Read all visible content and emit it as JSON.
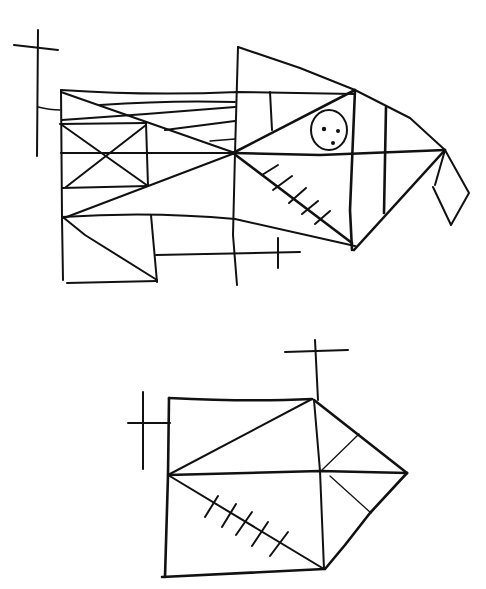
{
  "drawing": {
    "title": "Hand-drawn geometric sketch",
    "description": "Two ink line drawings: an upper fish-like composition of rectangles and triangles with a face circle, and a lower pentagon-like figure with hatching",
    "ink_color": "#111111",
    "paper_color": "#ffffff",
    "figures": [
      {
        "name": "upper-figure",
        "elements": [
          "crosshair-left",
          "grid-rectangles",
          "x-box",
          "triangle-fan",
          "face-circle",
          "hatch-marks",
          "tail-flap",
          "crosshair-bottom"
        ]
      },
      {
        "name": "lower-figure",
        "elements": [
          "crosshair-top",
          "crosshair-left",
          "square-body",
          "pointed-head",
          "hatch-marks"
        ]
      }
    ],
    "face": {
      "dots": 3
    }
  }
}
